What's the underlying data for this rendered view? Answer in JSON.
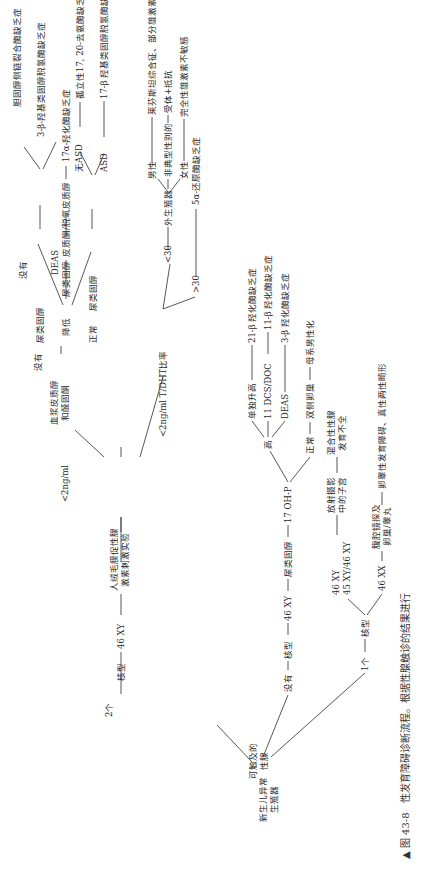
{
  "figure": {
    "caption_marker": "▲",
    "caption_label": "图 43-8",
    "caption_text": "性发育障碍诊断流程。根据性腺触诊的结果进行"
  },
  "root": {
    "label_line1": "新生儿异常",
    "label_line2": "生殖器"
  },
  "palpable": {
    "label_line1": "可触及的",
    "label_line2": "性腺"
  },
  "branch_two": {
    "count": "2个",
    "karyotype": "核型",
    "result": "46 XY",
    "test_line1": "人绒毛膜促性腺",
    "test_line2": "激素刺激实验",
    "low_a": "<2ng/ml",
    "plasma_line1": "血浆皮质醇",
    "plasma_line2": "和醛固酮",
    "plasma_none": {
      "label": "没有",
      "urine": "尿类固醇",
      "none": "没有",
      "deas": "DEAS",
      "dx_none": "胆固醇侧链裂合酶缺乏症",
      "dx_deas": "3-β-羟基类固醇脱氢酶缺乏症"
    },
    "plasma_low": {
      "label": "降低",
      "urine": "尿类固醇",
      "finding": "皮质酮/脱氧皮质醇",
      "dx": "17α-羟化酶缺乏症"
    },
    "plasma_normal": {
      "label": "正常",
      "urine": "尿类固醇",
      "no_asd": "无ASD",
      "asd": "ASD",
      "dx_no_asd": "孤立性17, 20-去氨酶缺乏症",
      "dx_asd": "17-β 羟基类固醇脱氢酶缺乏症"
    },
    "low_b": "<2ng/ml T/DHT比率",
    "ratio_lt30": {
      "label": "<30",
      "genitalia": "外生殖器",
      "male": "男性",
      "atypical": "非典型性别的",
      "female": "女性",
      "dx_male": "莱芬斯坦综合征、部分雄激素不敏感综合征",
      "dx_atypical": "受体+抵抗",
      "dx_female": "完全性雄激素不敏感"
    },
    "ratio_gt30": {
      "label": ">30",
      "dx": "5α-还原酶缺乏症"
    }
  },
  "branch_none": {
    "count": "没有",
    "karyotype": "核型",
    "result": "46 XY",
    "urine": "尿类固醇",
    "ohp": "17 OH-P",
    "high": "高",
    "high_alone": "单独升高",
    "high_dcs": "11 DCS/DOC",
    "high_deas": "DEAS",
    "dx_alone": "21-β 羟化酶缺乏症",
    "dx_dcs": "11-β 羟化酶缺乏症",
    "dx_deas": "3-β 羟化酶缺乏症",
    "normal": "正常",
    "ovaries": "双侧卵巢",
    "dx_normal": "母系男性化"
  },
  "branch_one": {
    "count": "1个",
    "karyotype": "核型",
    "mosaic_a": "46 XY",
    "mosaic_b": "45 XY/46 XY",
    "imaging_line1": "放射摄影",
    "imaging_line2": "中的子宫",
    "dx_mosaic_line1": "混合性性腺",
    "dx_mosaic_line2": "发育不全",
    "xx": "46 XX",
    "lap_line1": "腹腔镜探及",
    "lap_line2": "卵巢/睾丸",
    "dx_xx": "卵睾性发育障碍、真性两性畸形"
  }
}
